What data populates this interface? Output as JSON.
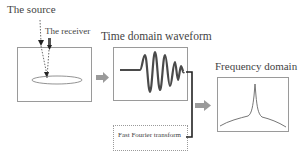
{
  "diagram": {
    "source": {
      "label": "The source"
    },
    "receiver": {
      "label": "The receiver"
    },
    "time_domain": {
      "label": "Time domain waveform"
    },
    "frequency_domain": {
      "label": "Frequency domain"
    },
    "fft": {
      "label": "Fast Fourier transform"
    }
  },
  "colors": {
    "waveform": "#4a4a4a",
    "box_border": "#9a9a9a",
    "arrow_fill": "#9a9a9a",
    "connector": "#222222"
  }
}
